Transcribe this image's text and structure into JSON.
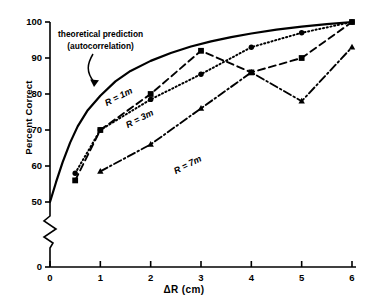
{
  "chart_data": {
    "type": "line",
    "title": "",
    "xlabel": "ΔR  (cm)",
    "ylabel": "Percent Correct",
    "xlim": [
      0,
      6
    ],
    "ylim": [
      50,
      100
    ],
    "y_axis_break": true,
    "y_break_from": 0,
    "y_break_to": 50,
    "grid": false,
    "legend_position": "inline-curve-labels",
    "xticks": [
      0,
      1,
      2,
      3,
      4,
      5,
      6
    ],
    "xticklabels": [
      "0",
      "1",
      "2",
      "3",
      "4",
      "5",
      "6"
    ],
    "yticks": [
      0,
      50,
      60,
      70,
      80,
      90,
      100
    ],
    "yticklabels": [
      "0",
      "50",
      "60",
      "70",
      "80",
      "90",
      "100"
    ],
    "annotations": [
      {
        "name": "theoretical-prediction-annotation",
        "line1": "theoretical prediction",
        "line2": "(autocorrelation)",
        "points_to": "solid-theory-curve"
      }
    ],
    "series": [
      {
        "name": "theoretical prediction (autocorrelation)",
        "label": "",
        "style": "solid",
        "marker": "none",
        "color": "#000000",
        "x": [
          0.0,
          0.12,
          0.25,
          0.4,
          0.55,
          0.75,
          1.0,
          1.3,
          1.6,
          2.0,
          2.4,
          2.8,
          3.2,
          3.6,
          4.0,
          4.5,
          5.0,
          5.5,
          6.0
        ],
        "y": [
          50.0,
          55.5,
          61.0,
          66.5,
          71.0,
          75.5,
          79.5,
          83.5,
          86.4,
          89.2,
          91.4,
          93.2,
          94.6,
          95.8,
          96.8,
          97.9,
          98.7,
          99.4,
          100.0
        ]
      },
      {
        "name": "R = 1m",
        "label": "R = 1m",
        "style": "dotted",
        "marker": "circle",
        "color": "#000000",
        "x": [
          0.5,
          1.0,
          2.0,
          3.0,
          4.0,
          5.0,
          6.0
        ],
        "y": [
          58.0,
          70.0,
          78.5,
          85.5,
          93.0,
          97.0,
          100.0
        ]
      },
      {
        "name": "R = 3m",
        "label": "R = 3m",
        "style": "dashed",
        "marker": "square",
        "color": "#000000",
        "x": [
          0.5,
          1.0,
          2.0,
          3.0,
          4.0,
          5.0,
          6.0
        ],
        "y": [
          56.0,
          70.0,
          80.0,
          92.0,
          86.0,
          90.0,
          100.0
        ]
      },
      {
        "name": "R = 7m",
        "label": "R = 7m",
        "style": "dashdot",
        "marker": "triangle",
        "color": "#000000",
        "x": [
          1.0,
          2.0,
          3.0,
          4.0,
          5.0,
          6.0
        ],
        "y": [
          58.5,
          66.0,
          76.0,
          86.0,
          78.0,
          93.0
        ]
      }
    ]
  }
}
